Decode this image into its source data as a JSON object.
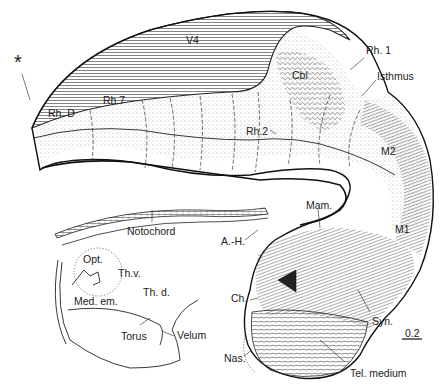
{
  "figure": {
    "type": "embryonic brain sagittal diagram",
    "labels": [
      {
        "id": "star",
        "text": "*",
        "x": 14,
        "y": 62
      },
      {
        "id": "v4",
        "text": "V4",
        "x": 186,
        "y": 40
      },
      {
        "id": "rh1",
        "text": "Rh. 1",
        "x": 366,
        "y": 46
      },
      {
        "id": "cbl",
        "text": "Cbl",
        "x": 292,
        "y": 72
      },
      {
        "id": "isthmus",
        "text": "Isthmus",
        "x": 377,
        "y": 72
      },
      {
        "id": "rhd",
        "text": "Rh. D",
        "x": 48,
        "y": 109
      },
      {
        "id": "rh7",
        "text": "Rh.7",
        "x": 103,
        "y": 96
      },
      {
        "id": "rh2",
        "text": "Rh.2",
        "x": 246,
        "y": 127
      },
      {
        "id": "m2",
        "text": "M2",
        "x": 381,
        "y": 147
      },
      {
        "id": "notochord",
        "text": "Notochord",
        "x": 127,
        "y": 227
      },
      {
        "id": "mam",
        "text": "Mam.",
        "x": 306,
        "y": 202
      },
      {
        "id": "m1",
        "text": "M1",
        "x": 395,
        "y": 227
      },
      {
        "id": "ah",
        "text": "A.-H.",
        "x": 221,
        "y": 239
      },
      {
        "id": "opt",
        "text": "Opt.",
        "x": 83,
        "y": 254
      },
      {
        "id": "thv",
        "text": "Th.v.",
        "x": 118,
        "y": 268
      },
      {
        "id": "thd",
        "text": "Th. d.",
        "x": 143,
        "y": 287
      },
      {
        "id": "medem",
        "text": "Med. em.",
        "x": 74,
        "y": 296
      },
      {
        "id": "ch",
        "text": "Ch.",
        "x": 231,
        "y": 297
      },
      {
        "id": "torus",
        "text": "Torus",
        "x": 121,
        "y": 331
      },
      {
        "id": "velum",
        "text": "Velum",
        "x": 177,
        "y": 330
      },
      {
        "id": "syn",
        "text": "Syn.",
        "x": 372,
        "y": 318
      },
      {
        "id": "scale",
        "text": "0.2",
        "x": 403,
        "y": 331
      },
      {
        "id": "nas",
        "text": "Nas.",
        "x": 224,
        "y": 353
      },
      {
        "id": "telmedium",
        "text": "Tel. medium",
        "x": 350,
        "y": 366
      }
    ]
  }
}
